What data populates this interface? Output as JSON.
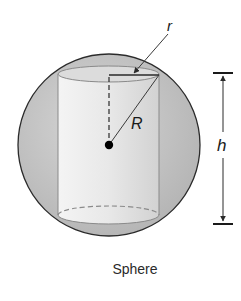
{
  "figure": {
    "caption": "Sphere",
    "labels": {
      "small_radius": "r",
      "sphere_radius": "R",
      "height": "h"
    },
    "colors": {
      "sphere_fill": "#c4c4c4",
      "sphere_stroke": "#2b2b2b",
      "cylinder_fill": "#e6e6e6",
      "cylinder_stroke": "#8a8a8a",
      "line": "#3a3a3a"
    }
  }
}
